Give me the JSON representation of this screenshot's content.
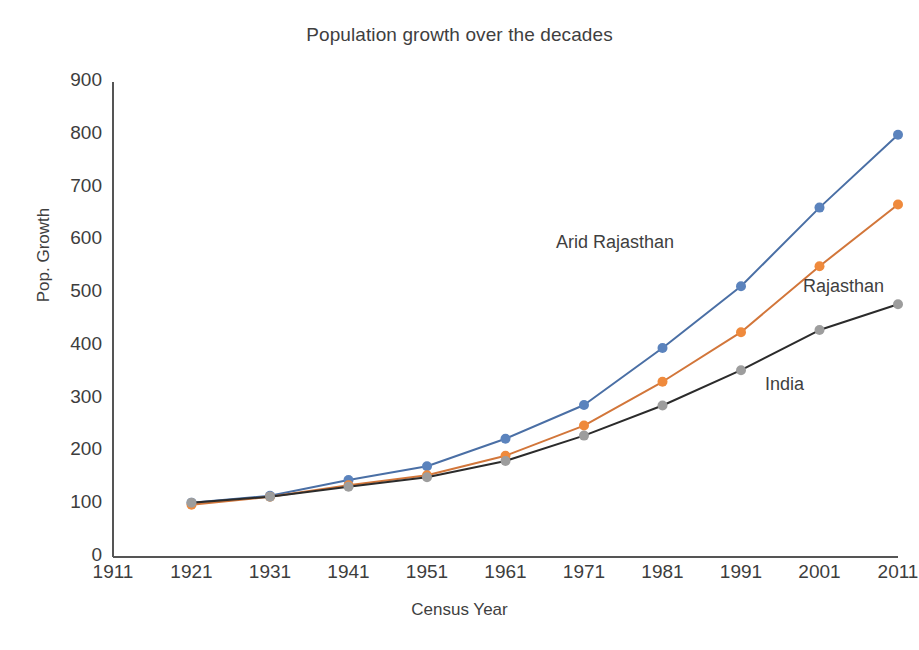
{
  "chart_data": {
    "type": "line",
    "title": "Population growth over the decades",
    "xlabel": "Census Year",
    "ylabel": "Pop. Growth",
    "categories": [
      "1911",
      "1921",
      "1931",
      "1941",
      "1951",
      "1961",
      "1971",
      "1981",
      "1991",
      "2001",
      "2011"
    ],
    "x": [
      1911,
      1921,
      1931,
      1941,
      1951,
      1961,
      1971,
      1981,
      1991,
      2001,
      2011
    ],
    "xlim": [
      1911,
      2011
    ],
    "ylim": [
      0,
      900
    ],
    "ytick_labels": [
      "0",
      "100",
      "200",
      "300",
      "400",
      "500",
      "600",
      "700",
      "800",
      "900"
    ],
    "yticks": [
      0,
      100,
      200,
      300,
      400,
      500,
      600,
      700,
      800,
      900
    ],
    "grid": false,
    "legend_position": "inline-annotations",
    "series": [
      {
        "name": "Arid Rajasthan",
        "color": "#4a6fa5",
        "marker_color": "#5b83bd",
        "x": [
          1921,
          1931,
          1941,
          1951,
          1961,
          1971,
          1981,
          1991,
          2001,
          2011
        ],
        "values": [
          103,
          116,
          146,
          172,
          224,
          288,
          396,
          513,
          662,
          800
        ]
      },
      {
        "name": "Rajasthan",
        "color": "#d2763a",
        "marker_color": "#ef8a3c",
        "x": [
          1921,
          1931,
          1941,
          1951,
          1961,
          1971,
          1981,
          1991,
          2001,
          2011
        ],
        "values": [
          99,
          114,
          136,
          155,
          192,
          249,
          332,
          426,
          551,
          668
        ]
      },
      {
        "name": "India",
        "color": "#2b2b2b",
        "marker_color": "#9d9d9d",
        "x": [
          1921,
          1931,
          1941,
          1951,
          1961,
          1971,
          1981,
          1991,
          2001,
          2011
        ],
        "values": [
          103,
          114,
          133,
          151,
          182,
          230,
          287,
          354,
          430,
          479
        ]
      }
    ],
    "annotations": [
      {
        "text": "Arid Rajasthan",
        "x_px": 556,
        "y_px": 232
      },
      {
        "text": "Rajasthan",
        "x_px": 803,
        "y_px": 276
      },
      {
        "text": "India",
        "x_px": 765,
        "y_px": 374
      }
    ]
  },
  "axes": {
    "y_axis_color": "#555555",
    "x_axis_color": "#555555"
  }
}
